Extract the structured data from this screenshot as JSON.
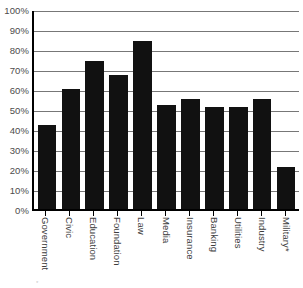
{
  "chart_data": {
    "type": "bar",
    "title": "",
    "subtitle": "",
    "xlabel": "",
    "ylabel": "",
    "categories": [
      "Government",
      "Civic",
      "Education",
      "Foundation",
      "Law",
      "Media",
      "Insurance",
      "Banking",
      "Utilities",
      "Industry",
      "Military*"
    ],
    "values": [
      42,
      60,
      74,
      67,
      84,
      52,
      55,
      51,
      51,
      55,
      21
    ],
    "ylim": [
      0,
      100
    ],
    "ytick_labels": [
      "100%",
      "90%",
      "80%",
      "70%",
      "60%",
      "50%",
      "40%",
      "30%",
      "20%",
      "10%",
      "0%"
    ],
    "ytick_values": [
      100,
      90,
      80,
      70,
      60,
      50,
      40,
      30,
      20,
      10,
      0
    ],
    "grid": true,
    "grid_axis": "y",
    "legend": false,
    "legend_position": "none",
    "bar_color": "#111111",
    "grid_color": "#777777",
    "axis_color": "#000000",
    "tick_label_color": "#4c4c4c",
    "value_suffix": "%"
  },
  "footnote": {
    "text": "*"
  }
}
